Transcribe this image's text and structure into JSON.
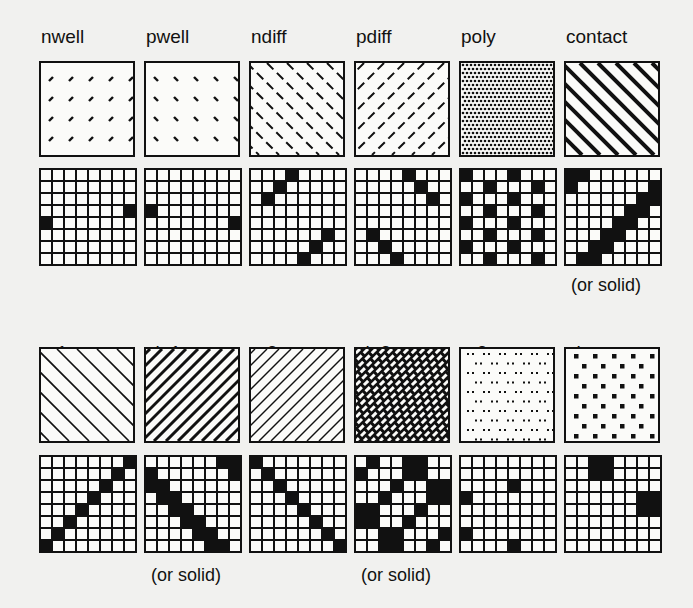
{
  "figure": {
    "rows": [
      {
        "layers": [
          {
            "name": "nwell",
            "pattern": "dashes-slash-sparse",
            "grid": [
              [
                3,
                7
              ],
              [
                4,
                0
              ]
            ],
            "note": ""
          },
          {
            "name": "pwell",
            "pattern": "dashes-backslash-sparse",
            "grid": [
              [
                3,
                0
              ],
              [
                4,
                7
              ]
            ],
            "note": ""
          },
          {
            "name": "ndiff",
            "pattern": "dashed-backslash-lines",
            "grid": [
              [
                0,
                3
              ],
              [
                1,
                2
              ],
              [
                2,
                1
              ],
              [
                5,
                6
              ],
              [
                6,
                5
              ],
              [
                7,
                4
              ]
            ],
            "note": ""
          },
          {
            "name": "pdiff",
            "pattern": "dashed-slash-lines",
            "grid": [
              [
                0,
                4
              ],
              [
                1,
                5
              ],
              [
                2,
                6
              ],
              [
                5,
                1
              ],
              [
                6,
                2
              ],
              [
                7,
                3
              ]
            ],
            "note": ""
          },
          {
            "name": "poly",
            "pattern": "dense-dots",
            "grid": [
              [
                0,
                0
              ],
              [
                0,
                4
              ],
              [
                1,
                2
              ],
              [
                1,
                6
              ],
              [
                2,
                0
              ],
              [
                2,
                4
              ],
              [
                3,
                2
              ],
              [
                3,
                6
              ],
              [
                4,
                0
              ],
              [
                4,
                4
              ],
              [
                5,
                2
              ],
              [
                5,
                6
              ],
              [
                6,
                0
              ],
              [
                6,
                4
              ],
              [
                7,
                2
              ],
              [
                7,
                6
              ]
            ],
            "note": ""
          },
          {
            "name": "contact",
            "pattern": "thick-backslash-lines",
            "grid": [
              [
                0,
                0
              ],
              [
                0,
                1
              ],
              [
                1,
                0
              ],
              [
                1,
                7
              ],
              [
                2,
                6
              ],
              [
                2,
                7
              ],
              [
                3,
                5
              ],
              [
                3,
                6
              ],
              [
                4,
                4
              ],
              [
                4,
                5
              ],
              [
                5,
                3
              ],
              [
                5,
                4
              ],
              [
                6,
                2
              ],
              [
                6,
                3
              ],
              [
                7,
                1
              ],
              [
                7,
                2
              ]
            ],
            "note": "(or solid)"
          }
        ]
      },
      {
        "layers": [
          {
            "name": "m1",
            "pattern": "thin-backslash-lines",
            "grid": [
              [
                0,
                7
              ],
              [
                1,
                6
              ],
              [
                2,
                5
              ],
              [
                3,
                4
              ],
              [
                4,
                3
              ],
              [
                5,
                2
              ],
              [
                6,
                1
              ],
              [
                7,
                0
              ]
            ],
            "note": ""
          },
          {
            "name": "via1",
            "pattern": "thick-slash-lines",
            "grid": [
              [
                0,
                6
              ],
              [
                0,
                7
              ],
              [
                1,
                0
              ],
              [
                1,
                7
              ],
              [
                2,
                0
              ],
              [
                2,
                1
              ],
              [
                3,
                1
              ],
              [
                3,
                2
              ],
              [
                4,
                2
              ],
              [
                4,
                3
              ],
              [
                5,
                3
              ],
              [
                5,
                4
              ],
              [
                6,
                4
              ],
              [
                6,
                5
              ],
              [
                7,
                5
              ],
              [
                7,
                6
              ]
            ],
            "note": "(or solid)"
          },
          {
            "name": "m2",
            "pattern": "thin-slash-lines",
            "grid": [
              [
                0,
                0
              ],
              [
                1,
                1
              ],
              [
                2,
                2
              ],
              [
                3,
                3
              ],
              [
                4,
                4
              ],
              [
                5,
                5
              ],
              [
                6,
                6
              ],
              [
                7,
                7
              ]
            ],
            "note": ""
          },
          {
            "name": "via2",
            "pattern": "crosshatch",
            "grid": [
              [
                0,
                1
              ],
              [
                0,
                4
              ],
              [
                0,
                5
              ],
              [
                1,
                0
              ],
              [
                1,
                4
              ],
              [
                1,
                5
              ],
              [
                2,
                3
              ],
              [
                2,
                6
              ],
              [
                2,
                7
              ],
              [
                3,
                2
              ],
              [
                3,
                6
              ],
              [
                3,
                7
              ],
              [
                4,
                0
              ],
              [
                4,
                1
              ],
              [
                4,
                5
              ],
              [
                5,
                0
              ],
              [
                5,
                1
              ],
              [
                5,
                4
              ],
              [
                6,
                2
              ],
              [
                6,
                3
              ],
              [
                6,
                7
              ],
              [
                7,
                2
              ],
              [
                7,
                3
              ],
              [
                7,
                6
              ]
            ],
            "note": "(or solid)"
          },
          {
            "name": "m3",
            "pattern": "sparse-dot-pairs",
            "grid": [
              [
                2,
                4
              ],
              [
                3,
                0
              ],
              [
                6,
                0
              ],
              [
                7,
                4
              ]
            ],
            "note": ""
          },
          {
            "name": "glass",
            "pattern": "square-dots-staggered",
            "grid": [
              [
                0,
                2
              ],
              [
                0,
                3
              ],
              [
                1,
                2
              ],
              [
                1,
                3
              ],
              [
                3,
                6
              ],
              [
                3,
                7
              ],
              [
                4,
                6
              ],
              [
                4,
                7
              ]
            ],
            "note": ""
          }
        ]
      }
    ],
    "colors": {
      "ink": "#111111",
      "paper": "#f1f1ef",
      "fill": "#fbfbf9"
    }
  }
}
